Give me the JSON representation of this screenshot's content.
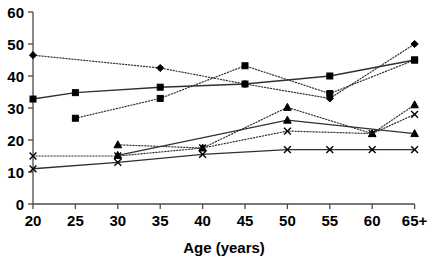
{
  "chart_data": {
    "type": "line",
    "title": "",
    "subtitle": "",
    "xlabel": "Age (years)",
    "ylabel": "",
    "categories": [
      "20",
      "25",
      "30",
      "35",
      "40",
      "45",
      "50",
      "55",
      "60",
      "65+"
    ],
    "x_tick_labels": [
      "20",
      "25",
      "30",
      "35",
      "40",
      "45",
      "50",
      "55",
      "60",
      "65+"
    ],
    "y_tick_labels": [
      "0",
      "10",
      "20",
      "30",
      "40",
      "50",
      "60"
    ],
    "y_ticks": [
      0,
      10,
      20,
      30,
      40,
      50,
      60
    ],
    "ylim": [
      0,
      60
    ],
    "xlim": [
      20,
      70
    ],
    "grid": false,
    "legend": "none",
    "legend_position": "none",
    "series": [
      {
        "name": "series-diamond-dotted-upper",
        "marker": "diamond",
        "line_style": "dotted",
        "color": "#000000",
        "x": [
          "20",
          "35",
          "45",
          "55",
          "65+"
        ],
        "values": [
          46.5,
          42.5,
          37.5,
          33,
          50
        ]
      },
      {
        "name": "series-square-solid",
        "marker": "square",
        "line_style": "solid",
        "color": "#303030",
        "x": [
          "20",
          "25",
          "35",
          "45",
          "55",
          "65+"
        ],
        "values": [
          32.8,
          34.8,
          36.5,
          37.5,
          40,
          45
        ]
      },
      {
        "name": "series-square-dotted-rising",
        "marker": "square",
        "line_style": "dotted",
        "color": "#303030",
        "x": [
          "25",
          "35",
          "45",
          "55",
          "65+"
        ],
        "values": [
          26.8,
          33,
          43.2,
          34.5,
          45
        ]
      },
      {
        "name": "series-triangle-dotted",
        "marker": "triangle",
        "line_style": "dotted",
        "color": "#000000",
        "x": [
          "30",
          "40",
          "50",
          "60",
          "65+"
        ],
        "values": [
          18.5,
          17.5,
          30.2,
          22,
          31
        ]
      },
      {
        "name": "series-triangle-solid",
        "marker": "triangle",
        "line_style": "solid",
        "color": "#303030",
        "x": [
          "30",
          "50",
          "65+"
        ],
        "values": [
          15.2,
          26.2,
          22
        ]
      },
      {
        "name": "series-x-dotted",
        "marker": "x",
        "line_style": "dotted",
        "color": "#000000",
        "x": [
          "20",
          "30",
          "40",
          "50",
          "60",
          "65+"
        ],
        "values": [
          15,
          15,
          17.5,
          22.8,
          22,
          28
        ]
      },
      {
        "name": "series-x-solid",
        "marker": "x",
        "line_style": "solid",
        "color": "#303030",
        "x": [
          "20",
          "30",
          "40",
          "50",
          "55",
          "60",
          "65+"
        ],
        "values": [
          11,
          13,
          15.5,
          17,
          17,
          17,
          17
        ]
      }
    ]
  },
  "axis": {
    "x_title": "Age (years)"
  }
}
